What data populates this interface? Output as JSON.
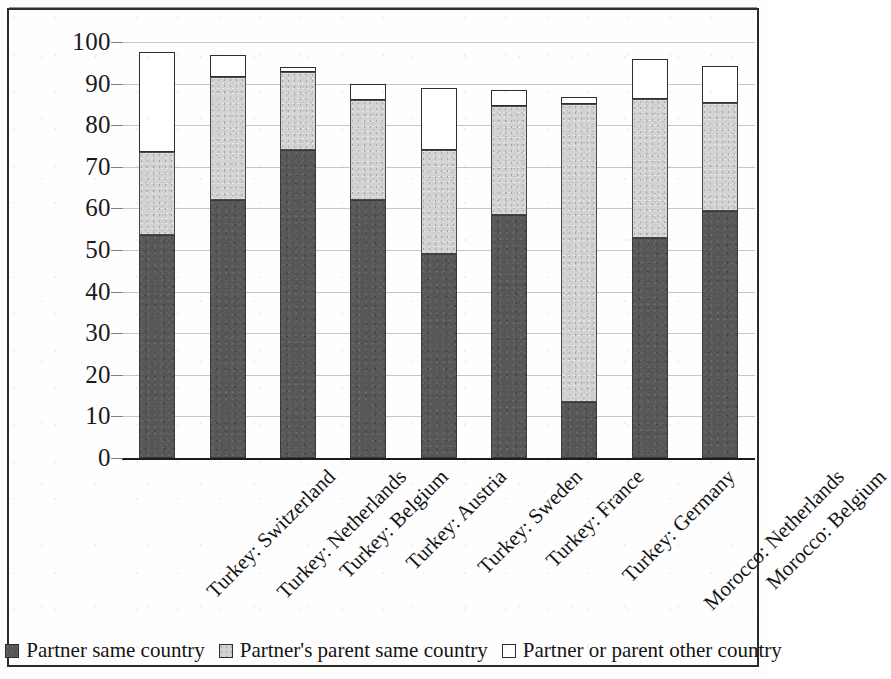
{
  "chart_data": {
    "type": "bar",
    "subtype": "stacked-bar",
    "title": "",
    "subtitle": "",
    "xlabel": "",
    "ylabel": "",
    "ylim": [
      0,
      100
    ],
    "ytick_step": 10,
    "ytick_labels": [
      "100",
      "90",
      "80",
      "70",
      "60",
      "50",
      "40",
      "30",
      "20",
      "10",
      "0"
    ],
    "ytick_values": [
      100,
      90,
      80,
      70,
      60,
      50,
      40,
      30,
      20,
      10,
      0
    ],
    "grid": true,
    "grid_axis": "y",
    "legend_position": "bottom",
    "stacked_total_note": "Segments stack bottom-to-top: dark, light, white",
    "categories": [
      "Turkey: Switzerland",
      "Turkey: Netherlands",
      "Turkey: Belgium",
      "Turkey: Austria",
      "Turkey: Sweden",
      "Turkey: France",
      "Turkey: Germany",
      "Morocco: Netherlands",
      "Morocco: Belgium"
    ],
    "series": [
      {
        "name": "Partner same country",
        "swatch": "dark",
        "color": "#575757",
        "values": [
          53.5,
          62.0,
          74.0,
          62.0,
          49.0,
          58.5,
          13.5,
          53.0,
          59.3
        ]
      },
      {
        "name": "Partner's parent same country",
        "swatch": "light",
        "color": "#d2d2d2",
        "values": [
          20.0,
          29.5,
          18.7,
          24.0,
          25.0,
          26.2,
          71.5,
          33.3,
          26.0
        ]
      },
      {
        "name": "Partner or parent other country",
        "swatch": "white",
        "color": "#ffffff",
        "values": [
          24.0,
          5.5,
          1.3,
          3.8,
          15.0,
          3.8,
          1.8,
          9.5,
          8.9
        ]
      }
    ],
    "totals": [
      97.5,
      97.0,
      94.0,
      89.8,
      89.0,
      88.5,
      86.8,
      95.8,
      94.2
    ]
  },
  "legend": {
    "items": [
      {
        "label": "Partner same country",
        "swatch": "dark"
      },
      {
        "label": "Partner's parent same country",
        "swatch": "light"
      },
      {
        "label": "Partner or parent other country",
        "swatch": "white"
      }
    ]
  },
  "colors": {
    "dark": "#575757",
    "light": "#d2d2d2",
    "white": "#ffffff",
    "gridline": "#b9bcc4",
    "axis": "#1c1c1c",
    "border": "#2b2b2b",
    "text": "#141414"
  }
}
